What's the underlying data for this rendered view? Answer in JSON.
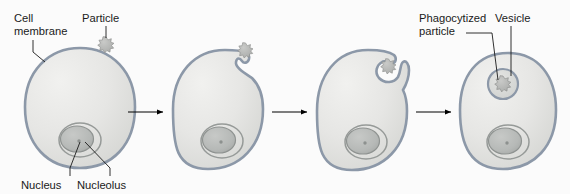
{
  "figure": {
    "background_color": "#fbfbfb",
    "membrane_color": "#8c98a8",
    "cytoplasm_color": "#e4e4e2",
    "nucleus_color": "#b9bcbb",
    "particle_color": "#b6b8b6",
    "arrow_color": "#000000",
    "leader_color": "#1a1a1a",
    "label_color": "#1a1a1a"
  },
  "labels": {
    "cell_membrane_line1": "Cell",
    "cell_membrane_line2": "membrane",
    "particle": "Particle",
    "nucleus": "Nucleus",
    "nucleolus": "Nucleolus",
    "phagocytized_line1": "Phagocytized",
    "phagocytized_line2": "particle",
    "vesicle": "Vesicle"
  },
  "stages": [
    {
      "index": 1,
      "name": "particle-approaching-cell",
      "description": "Intact cell with nucleus and nucleolus; free particle outside near the upper membrane",
      "has_particle_outside": true,
      "membrane_shape": "smooth-oval"
    },
    {
      "index": 2,
      "name": "membrane-indenting",
      "description": "Membrane begins to indent beneath the particle forming a shallow depression",
      "has_particle_outside": true,
      "membrane_shape": "shallow-notch"
    },
    {
      "index": 3,
      "name": "membrane-engulfing",
      "description": "Membrane pseudopods extend around the particle forming a deep cup",
      "has_particle_outside": true,
      "membrane_shape": "deep-cup"
    },
    {
      "index": 4,
      "name": "vesicle-formed",
      "description": "Particle fully enclosed inside an intracellular vesicle",
      "has_particle_outside": false,
      "membrane_shape": "smooth-oval"
    }
  ],
  "arrows": [
    {
      "name": "arrow-stage1-to-stage2",
      "from_stage": 1,
      "to_stage": 2
    },
    {
      "name": "arrow-stage2-to-stage3",
      "from_stage": 2,
      "to_stage": 3
    },
    {
      "name": "arrow-stage3-to-stage4",
      "from_stage": 3,
      "to_stage": 4
    }
  ]
}
